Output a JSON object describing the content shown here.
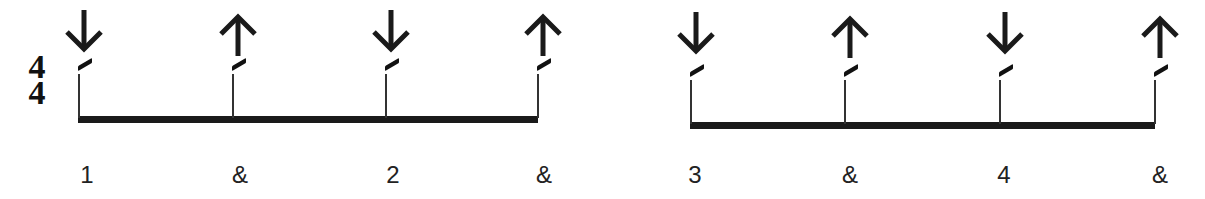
{
  "time_signature": {
    "top": "4",
    "bottom": "4"
  },
  "colors": {
    "ink": "#1a1a1a",
    "background": "#ffffff"
  },
  "measures": [
    {
      "beam": {
        "x1": 78,
        "x2": 538,
        "y": 116
      },
      "beats": [
        {
          "label": "1",
          "stroke": "down",
          "stem_x": 78,
          "label_x": 87
        },
        {
          "label": "&",
          "stroke": "up",
          "stem_x": 232,
          "label_x": 240
        },
        {
          "label": "2",
          "stroke": "down",
          "stem_x": 385,
          "label_x": 393
        },
        {
          "label": "&",
          "stroke": "up",
          "stem_x": 537,
          "label_x": 544
        }
      ]
    },
    {
      "beam": {
        "x1": 690,
        "x2": 1155,
        "y": 122
      },
      "beats": [
        {
          "label": "3",
          "stroke": "down",
          "stem_x": 690,
          "label_x": 695
        },
        {
          "label": "&",
          "stroke": "up",
          "stem_x": 844,
          "label_x": 850
        },
        {
          "label": "4",
          "stroke": "down",
          "stem_x": 999,
          "label_x": 1004
        },
        {
          "label": "&",
          "stroke": "up",
          "stem_x": 1154,
          "label_x": 1160
        }
      ]
    }
  ],
  "icons": {
    "down": "down-arrow-icon (downstroke)",
    "up": "up-arrow-icon (upstroke)"
  }
}
